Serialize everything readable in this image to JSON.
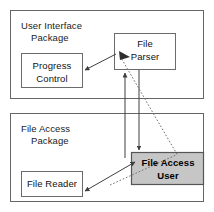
{
  "diagram": {
    "type": "uml-package-diagram",
    "colors": {
      "background": "#ffffff",
      "stroke": "#4d4d4d",
      "node_stroke": "#666666",
      "highlight_fill": "#c6c6c6",
      "highlight_stroke": "#555555",
      "text": "#111111"
    },
    "packages": [
      {
        "id": "user-interface-package",
        "label_line1": "User Interface",
        "label_line2": "Package",
        "x": 10,
        "y": 10,
        "w": 194,
        "h": 89
      },
      {
        "id": "file-access-package",
        "label_line1": "File Access",
        "label_line2": "Package",
        "x": 10,
        "y": 113,
        "w": 194,
        "h": 89
      }
    ],
    "nodes": [
      {
        "id": "progress-control",
        "label_line1": "Progress",
        "label_line2": "Control",
        "x": 21,
        "y": 53,
        "w": 62,
        "h": 35,
        "highlighted": false
      },
      {
        "id": "file-parser",
        "label_line1": "File",
        "label_line2": "Parser",
        "x": 114,
        "y": 33,
        "w": 62,
        "h": 37,
        "highlighted": false
      },
      {
        "id": "file-reader",
        "label_line1": "File Reader",
        "label_line2": "",
        "x": 21,
        "y": 171,
        "w": 62,
        "h": 26,
        "highlighted": false
      },
      {
        "id": "file-access-user",
        "label_line1": "File Access",
        "label_line2": "User",
        "x": 131,
        "y": 152,
        "w": 73,
        "h": 33,
        "highlighted": true
      }
    ],
    "connectors": [
      {
        "id": "file-parser-to-progress-control",
        "from": "file-parser",
        "to": "progress-control",
        "style": "solid",
        "arrows": "end"
      },
      {
        "id": "file-access-user-to-file-parser",
        "from": "file-access-user",
        "to": "file-parser",
        "style": "solid",
        "arrows": "end"
      },
      {
        "id": "file-parser-to-file-access-user",
        "from": "file-parser",
        "to": "file-access-user",
        "style": "solid",
        "arrows": "end"
      },
      {
        "id": "file-reader-file-access-user-bidirectional",
        "from": "file-reader",
        "to": "file-access-user",
        "style": "solid",
        "arrows": "both"
      },
      {
        "id": "file-parser-to-file-access-user-dependency",
        "from": "file-parser",
        "to": "file-access-user",
        "style": "dotted",
        "arrows": "none"
      }
    ]
  }
}
